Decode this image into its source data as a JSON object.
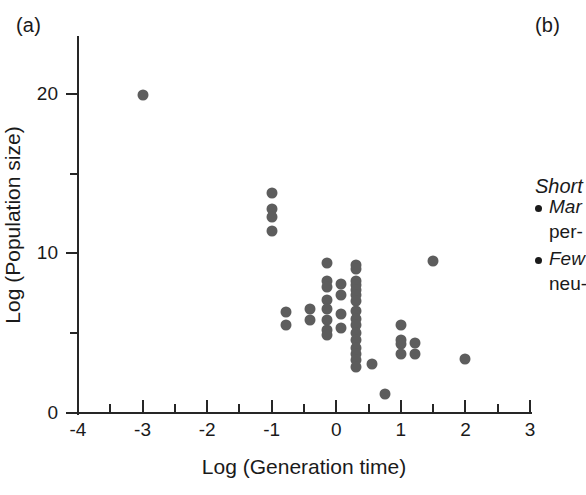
{
  "figure": {
    "panel_a_label": "(a)",
    "panel_b_label": "(b)"
  },
  "panel_b": {
    "heading": "Short",
    "bullets": [
      {
        "line1": "Mar",
        "line2": "per-"
      },
      {
        "line1": "Few",
        "line2": "neu-"
      }
    ]
  },
  "chart_data": {
    "type": "scatter",
    "title": "",
    "xlabel": "Log (Generation time)",
    "ylabel": "Log (Population size)",
    "xlim": [
      -4,
      3
    ],
    "ylim": [
      0,
      23.5
    ],
    "xticks": [
      -4,
      -3,
      -2,
      -1,
      0,
      1,
      2,
      3
    ],
    "xtick_labels": [
      "-4",
      "-3",
      "-2",
      "-1",
      "0",
      "1",
      "2",
      "3"
    ],
    "xminor_ticks": [
      -3.5,
      -2.5,
      -1.5,
      -0.5,
      0.5,
      1.5,
      2.5
    ],
    "yticks": [
      0,
      10,
      20
    ],
    "ytick_labels": [
      "0",
      "10",
      "20"
    ],
    "yminor_ticks": [
      5,
      15
    ],
    "grid": false,
    "legend": null,
    "marker_color": "#5d5d5d",
    "axis_color": "#262626",
    "points": [
      [
        -3.0,
        19.9
      ],
      [
        -1.0,
        13.8
      ],
      [
        -1.0,
        12.8
      ],
      [
        -1.0,
        12.3
      ],
      [
        -1.0,
        11.4
      ],
      [
        -0.78,
        6.3
      ],
      [
        -0.78,
        5.5
      ],
      [
        -0.4,
        6.5
      ],
      [
        -0.4,
        5.8
      ],
      [
        -0.15,
        9.4
      ],
      [
        -0.15,
        8.3
      ],
      [
        -0.15,
        7.9
      ],
      [
        -0.15,
        7.1
      ],
      [
        -0.15,
        6.5
      ],
      [
        -0.15,
        5.8
      ],
      [
        -0.15,
        5.2
      ],
      [
        -0.15,
        4.9
      ],
      [
        0.08,
        8.1
      ],
      [
        0.08,
        7.4
      ],
      [
        0.08,
        6.2
      ],
      [
        0.08,
        5.3
      ],
      [
        0.3,
        9.3
      ],
      [
        0.3,
        9.0
      ],
      [
        0.3,
        8.3
      ],
      [
        0.3,
        8.0
      ],
      [
        0.3,
        7.7
      ],
      [
        0.3,
        7.4
      ],
      [
        0.3,
        7.0
      ],
      [
        0.3,
        6.4
      ],
      [
        0.3,
        5.9
      ],
      [
        0.3,
        5.5
      ],
      [
        0.3,
        5.0
      ],
      [
        0.3,
        4.6
      ],
      [
        0.3,
        4.1
      ],
      [
        0.3,
        3.7
      ],
      [
        0.3,
        3.3
      ],
      [
        0.3,
        2.9
      ],
      [
        0.55,
        3.1
      ],
      [
        0.75,
        1.2
      ],
      [
        1.0,
        5.5
      ],
      [
        1.0,
        4.6
      ],
      [
        1.0,
        4.3
      ],
      [
        1.0,
        3.7
      ],
      [
        1.22,
        4.4
      ],
      [
        1.22,
        3.7
      ],
      [
        1.5,
        9.5
      ],
      [
        2.0,
        3.4
      ]
    ]
  }
}
